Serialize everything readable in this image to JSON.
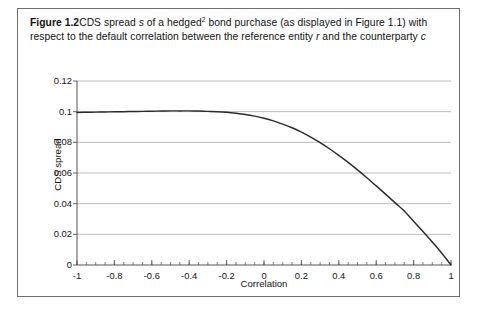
{
  "caption": {
    "figure_label": "Figure 1.2",
    "text_part1": "CDS spread ",
    "italic_s": "s",
    "text_part2": " of a hedged",
    "footnote_marker": "2",
    "text_part3": " bond purchase (as displayed in Figure 1.1) with respect to the default correlation between the reference entity ",
    "italic_r": "r",
    "text_part4": " and the counterparty ",
    "italic_c": "c"
  },
  "chart_data": {
    "type": "line",
    "title": "",
    "xlabel": "Correlation",
    "ylabel": "CDS spread",
    "xlim": [
      -1,
      1
    ],
    "ylim": [
      0,
      0.12
    ],
    "grid": "horizontal",
    "legend": "none",
    "line_color": "#2b2b2b",
    "grid_color": "#b5b5b5",
    "axis_color": "#555555",
    "xticks": [
      -1,
      -0.8,
      -0.6,
      -0.4,
      -0.2,
      0,
      0.2,
      0.4,
      0.6,
      0.8,
      1
    ],
    "xtick_labels": [
      "-1",
      "-0.8",
      "-0.6",
      "-0.4",
      "-0.2",
      "0",
      "0.2",
      "0.4",
      "0.6",
      "0.8",
      "1"
    ],
    "yticks": [
      0,
      0.02,
      0.04,
      0.06,
      0.08,
      0.1,
      0.12
    ],
    "ytick_labels": [
      "0",
      "0.02",
      "0.04",
      "0.06",
      "0.08",
      "0.1",
      "0.12"
    ],
    "xminor_step": 0.05,
    "series": [
      {
        "name": "CDS spread s",
        "x": [
          -1.0,
          -0.95,
          -0.9,
          -0.85,
          -0.8,
          -0.75,
          -0.7,
          -0.65,
          -0.6,
          -0.55,
          -0.5,
          -0.45,
          -0.4,
          -0.35,
          -0.3,
          -0.25,
          -0.2,
          -0.15,
          -0.1,
          -0.05,
          0.0,
          0.05,
          0.1,
          0.15,
          0.2,
          0.25,
          0.3,
          0.35,
          0.4,
          0.45,
          0.5,
          0.55,
          0.6,
          0.65,
          0.7,
          0.75,
          0.8,
          0.85,
          0.9,
          0.95,
          1.0
        ],
        "y": [
          0.0995,
          0.0996,
          0.0997,
          0.0998,
          0.0999,
          0.1,
          0.1001,
          0.1002,
          0.1003,
          0.1004,
          0.1005,
          0.1005,
          0.1005,
          0.1004,
          0.1002,
          0.1,
          0.0996,
          0.099,
          0.0982,
          0.0971,
          0.0957,
          0.094,
          0.0919,
          0.0895,
          0.0866,
          0.0834,
          0.0798,
          0.0758,
          0.0715,
          0.0669,
          0.062,
          0.0569,
          0.0516,
          0.0462,
          0.0407,
          0.0352,
          0.0285,
          0.0219,
          0.015,
          0.0078,
          0.0
        ]
      }
    ]
  }
}
